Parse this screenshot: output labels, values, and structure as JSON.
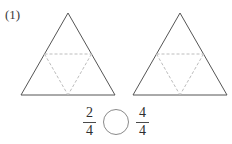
{
  "problem": {
    "number_label": "(1)",
    "figure_count": 2,
    "figures": [
      {
        "name": "triangle-left",
        "shape": "equilateral-triangle",
        "total_parts": 4,
        "shaded_parts": 0,
        "outline_color": "#555555",
        "division_line_color": "#bdbdbd",
        "division_line_style": "dashed"
      },
      {
        "name": "triangle-right",
        "shape": "equilateral-triangle",
        "total_parts": 4,
        "shaded_parts": 0,
        "outline_color": "#555555",
        "division_line_color": "#bdbdbd",
        "division_line_style": "dashed"
      }
    ],
    "comparison": {
      "left_fraction": {
        "numerator": "2",
        "denominator": "4"
      },
      "operator_placeholder": "",
      "right_fraction": {
        "numerator": "4",
        "denominator": "4"
      }
    }
  }
}
